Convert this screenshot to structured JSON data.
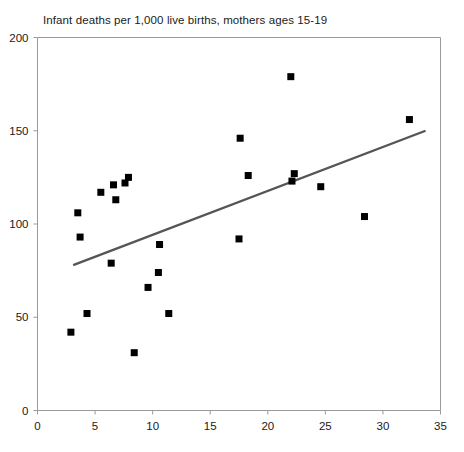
{
  "chart_data": {
    "type": "scatter",
    "title": "Infant deaths per 1,000 live births, mothers ages 15-19",
    "xlabel": "",
    "ylabel": "",
    "xlim": [
      0,
      35
    ],
    "ylim": [
      0,
      200
    ],
    "xticks": [
      0,
      5,
      10,
      15,
      20,
      25,
      30,
      35
    ],
    "yticks": [
      0,
      50,
      100,
      150,
      200
    ],
    "grid": false,
    "legend": "none",
    "marker_style": "filled-square",
    "marker_color": "#000000",
    "points": [
      {
        "x": 2.9,
        "y": 42
      },
      {
        "x": 3.5,
        "y": 106
      },
      {
        "x": 3.7,
        "y": 93
      },
      {
        "x": 4.3,
        "y": 52
      },
      {
        "x": 5.5,
        "y": 117
      },
      {
        "x": 6.4,
        "y": 79
      },
      {
        "x": 6.6,
        "y": 121
      },
      {
        "x": 6.8,
        "y": 113
      },
      {
        "x": 7.6,
        "y": 122
      },
      {
        "x": 7.9,
        "y": 125
      },
      {
        "x": 8.4,
        "y": 31
      },
      {
        "x": 9.6,
        "y": 66
      },
      {
        "x": 10.5,
        "y": 74
      },
      {
        "x": 10.6,
        "y": 89
      },
      {
        "x": 11.4,
        "y": 52
      },
      {
        "x": 17.5,
        "y": 92
      },
      {
        "x": 17.6,
        "y": 146
      },
      {
        "x": 18.3,
        "y": 126
      },
      {
        "x": 22.0,
        "y": 179
      },
      {
        "x": 22.1,
        "y": 123
      },
      {
        "x": 22.3,
        "y": 127
      },
      {
        "x": 24.6,
        "y": 120
      },
      {
        "x": 28.4,
        "y": 104
      },
      {
        "x": 32.3,
        "y": 156
      }
    ],
    "trend_line": {
      "color": "#555555",
      "x_start": 3.1,
      "y_start": 78,
      "x_end": 33.7,
      "y_end": 150
    }
  }
}
